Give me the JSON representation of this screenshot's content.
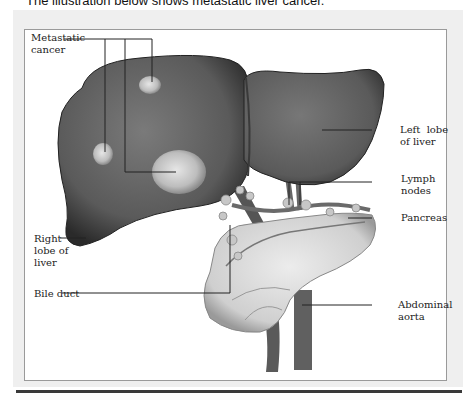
{
  "caption": "The illustration below shows metastatic liver cancer.",
  "figure": {
    "labels": {
      "metastatic_cancer": [
        "Metastatic",
        "cancer"
      ],
      "left_lobe": [
        "Left  lobe",
        "of liver"
      ],
      "lymph_nodes": [
        "Lymph",
        "nodes"
      ],
      "pancreas": [
        "Pancreas"
      ],
      "right_lobe": [
        "Right",
        "lobe of",
        "liver"
      ],
      "bile_duct": [
        "Bile duct"
      ],
      "abdominal_aorta": [
        "Abdominal",
        "aorta"
      ]
    },
    "colors": {
      "liver": "#5e5e5e",
      "liver_dark": "#2e2e2e",
      "tumor": "#c9c9c9",
      "pancreas": "#d9d9d9",
      "vessel": "#6a6a6a",
      "panel_bg": "#efefef",
      "frame_border": "#9a9a9a",
      "rule": "#3a3a3a"
    }
  }
}
